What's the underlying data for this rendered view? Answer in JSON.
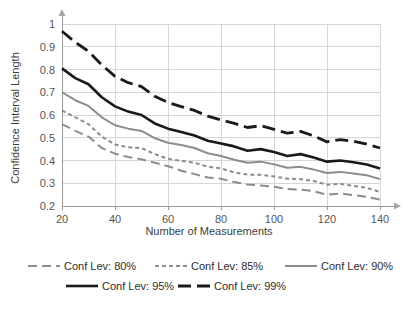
{
  "chart_data": {
    "type": "line",
    "title": "",
    "xlabel": "Number of Measurements",
    "ylabel": "Confidence Interval Length",
    "xlim": [
      20,
      140
    ],
    "ylim": [
      0.2,
      1.0
    ],
    "grid": true,
    "legend_position": "bottom",
    "xticks": [
      "20",
      "40",
      "60",
      "80",
      "100",
      "120",
      "140"
    ],
    "xtick_values": [
      20,
      40,
      60,
      80,
      100,
      120,
      140
    ],
    "yticks": [
      "0.2",
      "0.3",
      "0.4",
      "0.5",
      "0.6",
      "0.7",
      "0.8",
      "0.9",
      "1"
    ],
    "ytick_values": [
      0.2,
      0.3,
      0.4,
      0.5,
      0.6,
      0.7,
      0.8,
      0.9,
      1.0
    ],
    "x": [
      20,
      25,
      30,
      35,
      40,
      45,
      50,
      55,
      60,
      65,
      70,
      75,
      80,
      85,
      90,
      95,
      100,
      105,
      110,
      115,
      120,
      125,
      130,
      135,
      140
    ],
    "series": [
      {
        "name": "Conf Lev: 80%",
        "color": "#8c8c8c",
        "dash": "9,5",
        "width": 2,
        "values": [
          0.56,
          0.53,
          0.505,
          0.455,
          0.43,
          0.415,
          0.405,
          0.39,
          0.375,
          0.355,
          0.34,
          0.325,
          0.32,
          0.305,
          0.295,
          0.29,
          0.285,
          0.275,
          0.272,
          0.265,
          0.25,
          0.255,
          0.248,
          0.24,
          0.228
        ]
      },
      {
        "name": "Conf Lev: 85%",
        "color": "#8c8c8c",
        "dash": "4,3",
        "width": 2,
        "values": [
          0.62,
          0.59,
          0.56,
          0.505,
          0.47,
          0.458,
          0.455,
          0.428,
          0.408,
          0.398,
          0.39,
          0.373,
          0.365,
          0.348,
          0.338,
          0.337,
          0.33,
          0.32,
          0.318,
          0.31,
          0.293,
          0.298,
          0.288,
          0.28,
          0.262
        ]
      },
      {
        "name": "Conf Lev: 90%",
        "color": "#8c8c8c",
        "dash": "none",
        "width": 2,
        "values": [
          0.7,
          0.665,
          0.64,
          0.59,
          0.555,
          0.54,
          0.53,
          0.498,
          0.478,
          0.468,
          0.455,
          0.432,
          0.42,
          0.403,
          0.39,
          0.395,
          0.383,
          0.368,
          0.372,
          0.36,
          0.345,
          0.35,
          0.343,
          0.335,
          0.318
        ]
      },
      {
        "name": "Conf Lev: 95%",
        "color": "#1a1a1a",
        "dash": "none",
        "width": 2.6,
        "values": [
          0.805,
          0.762,
          0.735,
          0.678,
          0.638,
          0.615,
          0.6,
          0.563,
          0.54,
          0.525,
          0.51,
          0.487,
          0.475,
          0.462,
          0.443,
          0.45,
          0.437,
          0.42,
          0.428,
          0.413,
          0.395,
          0.4,
          0.392,
          0.382,
          0.365
        ]
      },
      {
        "name": "Conf Lev: 99%",
        "color": "#1a1a1a",
        "dash": "13,6",
        "width": 2.8,
        "values": [
          0.968,
          0.92,
          0.88,
          0.82,
          0.77,
          0.742,
          0.725,
          0.682,
          0.655,
          0.637,
          0.62,
          0.595,
          0.578,
          0.563,
          0.545,
          0.553,
          0.537,
          0.52,
          0.528,
          0.508,
          0.482,
          0.492,
          0.485,
          0.472,
          0.455
        ]
      }
    ]
  },
  "axes": {
    "ylabel": "Confidence Interval Length",
    "xlabel": "Number of Measurements",
    "ytick_labels": [
      "1",
      "0.9",
      "0.8",
      "0.7",
      "0.6",
      "0.5",
      "0.4",
      "0.3",
      "0.2"
    ],
    "xtick_labels": [
      "20",
      "40",
      "60",
      "80",
      "100",
      "120",
      "140"
    ]
  },
  "legend": {
    "row1": [
      {
        "label": "Conf Lev: 80%",
        "style": "long-dash-gray"
      },
      {
        "label": "Conf Lev: 85%",
        "style": "short-dash-gray"
      },
      {
        "label": "Conf Lev: 90%",
        "style": "solid-gray"
      }
    ],
    "row2": [
      {
        "label": "Conf Lev: 95%",
        "style": "solid-black"
      },
      {
        "label": "Conf Lev: 99%",
        "style": "long-dash-black"
      }
    ]
  }
}
